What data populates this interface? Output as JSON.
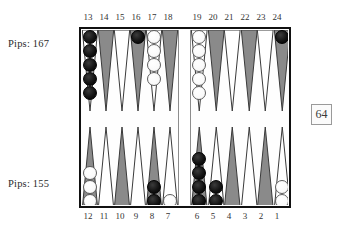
{
  "board": {
    "cube_value": "64",
    "colors": {
      "point_light": "#ffffff",
      "point_dark": "#8a8a8a",
      "checker_black": "#111111",
      "checker_white": "#fbfbfb",
      "border": "#111111"
    },
    "top_labels": [
      "13",
      "14",
      "15",
      "16",
      "17",
      "18",
      "19",
      "20",
      "21",
      "22",
      "23",
      "24"
    ],
    "bottom_labels": [
      "12",
      "11",
      "10",
      "9",
      "8",
      "7",
      "6",
      "5",
      "4",
      "3",
      "2",
      "1"
    ],
    "top_points": [
      {
        "label": "13",
        "color": "black",
        "count": 5,
        "shade": "light"
      },
      {
        "label": "14",
        "color": null,
        "count": 0,
        "shade": "dark"
      },
      {
        "label": "15",
        "color": null,
        "count": 0,
        "shade": "light"
      },
      {
        "label": "16",
        "color": "black",
        "count": 1,
        "shade": "dark"
      },
      {
        "label": "17",
        "color": "white",
        "count": 4,
        "shade": "light"
      },
      {
        "label": "18",
        "color": null,
        "count": 0,
        "shade": "dark"
      },
      {
        "label": "19",
        "color": "white",
        "count": 5,
        "shade": "light"
      },
      {
        "label": "20",
        "color": null,
        "count": 0,
        "shade": "dark"
      },
      {
        "label": "21",
        "color": null,
        "count": 0,
        "shade": "light"
      },
      {
        "label": "22",
        "color": null,
        "count": 0,
        "shade": "dark"
      },
      {
        "label": "23",
        "color": null,
        "count": 0,
        "shade": "light"
      },
      {
        "label": "24",
        "color": "black",
        "count": 1,
        "shade": "dark"
      }
    ],
    "bottom_points": [
      {
        "label": "12",
        "color": "white",
        "count": 3,
        "shade": "dark"
      },
      {
        "label": "11",
        "color": null,
        "count": 0,
        "shade": "light"
      },
      {
        "label": "10",
        "color": null,
        "count": 0,
        "shade": "dark"
      },
      {
        "label": "9",
        "color": null,
        "count": 0,
        "shade": "light"
      },
      {
        "label": "8",
        "color": "black",
        "count": 2,
        "shade": "dark"
      },
      {
        "label": "7",
        "color": "white",
        "count": 1,
        "shade": "light"
      },
      {
        "label": "6",
        "color": "black",
        "count": 4,
        "shade": "dark"
      },
      {
        "label": "5",
        "color": "black",
        "count": 2,
        "shade": "light"
      },
      {
        "label": "4",
        "color": null,
        "count": 0,
        "shade": "dark"
      },
      {
        "label": "3",
        "color": null,
        "count": 0,
        "shade": "light"
      },
      {
        "label": "2",
        "color": null,
        "count": 0,
        "shade": "dark"
      },
      {
        "label": "1",
        "color": "white",
        "count": 2,
        "shade": "light"
      }
    ]
  },
  "pips": {
    "top_label": "Pips: 167",
    "bottom_label": "Pips: 155"
  }
}
